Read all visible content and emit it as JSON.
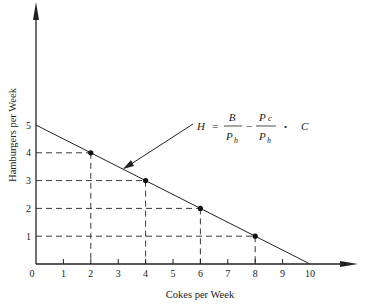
{
  "chart_data": {
    "type": "line",
    "title": "",
    "xlabel": "Cokes per Week",
    "ylabel": "Hamburgers per Week",
    "xlim": [
      0,
      10
    ],
    "ylim": [
      0,
      5
    ],
    "x_ticks": [
      0,
      1,
      2,
      3,
      4,
      5,
      6,
      7,
      8,
      9,
      10
    ],
    "y_ticks": [
      1,
      2,
      3,
      4,
      5
    ],
    "grid": false,
    "series": [
      {
        "name": "Budget line",
        "x": [
          0,
          10
        ],
        "y": [
          5,
          0
        ]
      }
    ],
    "highlighted_points": [
      {
        "x": 2,
        "y": 4
      },
      {
        "x": 4,
        "y": 3
      },
      {
        "x": 6,
        "y": 2
      },
      {
        "x": 8,
        "y": 1
      }
    ],
    "annotation": {
      "text": "H = B/P_h − (P_c/P_h) · C",
      "parts": {
        "lhs": "H",
        "eq": "=",
        "num1": "B",
        "den1": "P",
        "den1_sub": "h",
        "minus": "−",
        "num2": "P",
        "num2_sub": "c",
        "den2": "P",
        "den2_sub": "h",
        "dot": "•",
        "var": "C"
      }
    }
  }
}
